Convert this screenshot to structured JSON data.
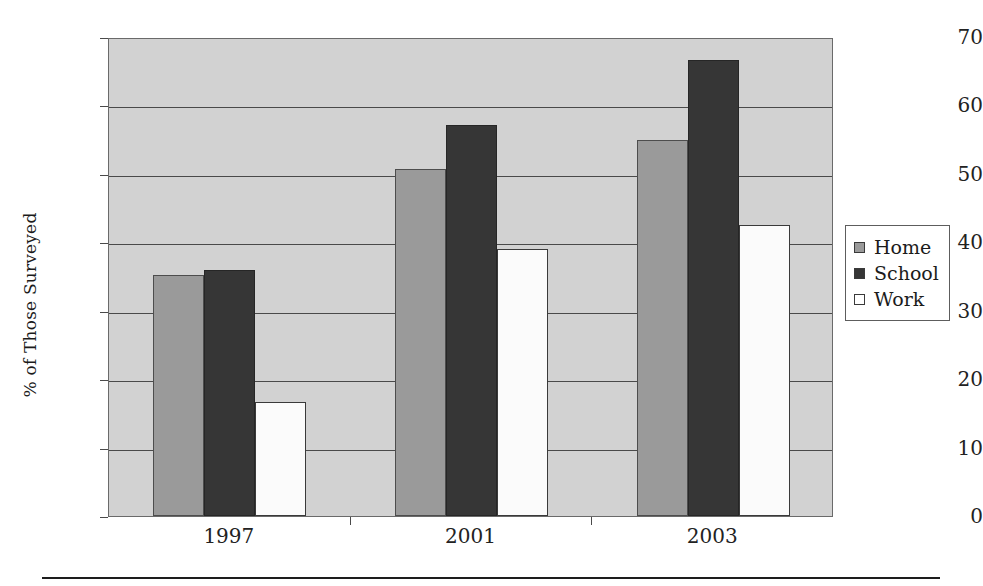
{
  "chart_data": {
    "type": "bar",
    "title": "",
    "xlabel": "",
    "ylabel": "% of Those Surveyed",
    "categories": [
      "1997",
      "2001",
      "2003"
    ],
    "series": [
      {
        "name": "Home",
        "color": "#9a9a9a",
        "values": [
          35.2,
          50.7,
          55.0
        ]
      },
      {
        "name": "School",
        "color": "#363636",
        "values": [
          36.0,
          57.2,
          66.7
        ]
      },
      {
        "name": "Work",
        "color": "#ffffff",
        "values": [
          16.7,
          39.0,
          42.5
        ]
      }
    ],
    "ylim": [
      0,
      70
    ],
    "yticks": [
      "0",
      "10",
      "20",
      "30",
      "40",
      "50",
      "60",
      "70"
    ],
    "ytick_values": [
      0,
      10,
      20,
      30,
      40,
      50,
      60,
      70
    ],
    "grid": "horizontal",
    "legend_position": "right",
    "plot_background": "#d2d2d2"
  },
  "legend": {
    "entries": [
      {
        "label": "Home",
        "swatch": "home-swatch"
      },
      {
        "label": "School",
        "swatch": "school-swatch"
      },
      {
        "label": "Work",
        "swatch": "work-swatch"
      }
    ]
  }
}
